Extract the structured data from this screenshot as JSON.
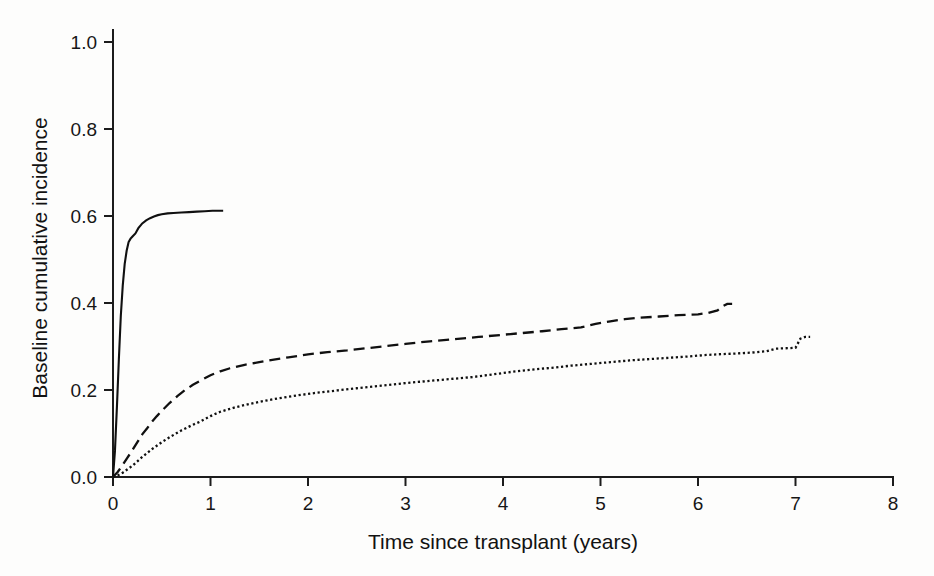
{
  "chart_data": {
    "type": "line",
    "title": "",
    "xlabel": "Time since transplant (years)",
    "ylabel": "Baseline cumulative incidence",
    "xlim": [
      0,
      8
    ],
    "ylim": [
      0.0,
      1.0
    ],
    "grid": false,
    "legend": "none",
    "xticks": [
      "0",
      "1",
      "2",
      "3",
      "4",
      "5",
      "6",
      "7",
      "8"
    ],
    "xtick_values": [
      0,
      1,
      2,
      3,
      4,
      5,
      6,
      7,
      8
    ],
    "yticks": [
      "0.0",
      "0.2",
      "0.4",
      "0.6",
      "0.8",
      "1.0"
    ],
    "ytick_values": [
      0.0,
      0.2,
      0.4,
      0.6,
      0.8,
      1.0
    ],
    "line_color": "#101010",
    "series": [
      {
        "name": "solid-curve",
        "style": "solid",
        "x": [
          0.0,
          0.02,
          0.04,
          0.06,
          0.08,
          0.1,
          0.12,
          0.14,
          0.16,
          0.18,
          0.2,
          0.23,
          0.26,
          0.3,
          0.34,
          0.38,
          0.42,
          0.46,
          0.5,
          0.56,
          0.62,
          0.7,
          0.78,
          0.86,
          0.94,
          1.02,
          1.08,
          1.13
        ],
        "y": [
          0.0,
          0.06,
          0.16,
          0.27,
          0.37,
          0.44,
          0.49,
          0.52,
          0.54,
          0.548,
          0.553,
          0.56,
          0.572,
          0.583,
          0.59,
          0.595,
          0.599,
          0.602,
          0.604,
          0.606,
          0.607,
          0.608,
          0.609,
          0.61,
          0.611,
          0.612,
          0.612,
          0.612
        ]
      },
      {
        "name": "dashed-curve",
        "style": "dashed",
        "x": [
          0.0,
          0.05,
          0.1,
          0.15,
          0.2,
          0.25,
          0.3,
          0.35,
          0.4,
          0.45,
          0.5,
          0.58,
          0.66,
          0.74,
          0.82,
          0.9,
          1.0,
          1.1,
          1.2,
          1.35,
          1.5,
          1.65,
          1.8,
          2.0,
          2.2,
          2.4,
          2.6,
          2.8,
          3.0,
          3.25,
          3.5,
          3.75,
          4.0,
          4.2,
          4.4,
          4.6,
          4.8,
          4.95,
          5.1,
          5.25,
          5.4,
          5.6,
          5.8,
          6.0,
          6.1,
          6.2,
          6.25,
          6.3,
          6.35
        ],
        "y": [
          0.0,
          0.012,
          0.028,
          0.045,
          0.062,
          0.08,
          0.098,
          0.112,
          0.127,
          0.14,
          0.152,
          0.17,
          0.186,
          0.2,
          0.212,
          0.222,
          0.234,
          0.243,
          0.25,
          0.258,
          0.264,
          0.27,
          0.275,
          0.282,
          0.287,
          0.291,
          0.296,
          0.301,
          0.306,
          0.312,
          0.317,
          0.322,
          0.327,
          0.331,
          0.335,
          0.34,
          0.344,
          0.352,
          0.358,
          0.363,
          0.366,
          0.369,
          0.372,
          0.374,
          0.377,
          0.383,
          0.392,
          0.398,
          0.398
        ]
      },
      {
        "name": "dotted-curve",
        "style": "dotted",
        "x": [
          0.0,
          0.05,
          0.1,
          0.15,
          0.2,
          0.25,
          0.3,
          0.4,
          0.5,
          0.6,
          0.7,
          0.8,
          0.9,
          1.0,
          1.1,
          1.25,
          1.4,
          1.55,
          1.7,
          1.9,
          2.1,
          2.3,
          2.5,
          2.75,
          3.0,
          3.25,
          3.5,
          3.7,
          3.9,
          4.1,
          4.3,
          4.5,
          4.7,
          4.9,
          5.1,
          5.3,
          5.5,
          5.7,
          5.9,
          6.05,
          6.2,
          6.4,
          6.55,
          6.7,
          6.8,
          6.9,
          7.0,
          7.05,
          7.1,
          7.15
        ],
        "y": [
          0.0,
          0.004,
          0.01,
          0.018,
          0.026,
          0.036,
          0.046,
          0.064,
          0.08,
          0.094,
          0.107,
          0.118,
          0.128,
          0.14,
          0.15,
          0.16,
          0.168,
          0.175,
          0.181,
          0.188,
          0.194,
          0.199,
          0.204,
          0.21,
          0.216,
          0.221,
          0.226,
          0.23,
          0.236,
          0.242,
          0.247,
          0.251,
          0.256,
          0.26,
          0.264,
          0.268,
          0.271,
          0.274,
          0.277,
          0.28,
          0.282,
          0.284,
          0.286,
          0.289,
          0.295,
          0.296,
          0.297,
          0.318,
          0.322,
          0.322
        ]
      }
    ]
  }
}
